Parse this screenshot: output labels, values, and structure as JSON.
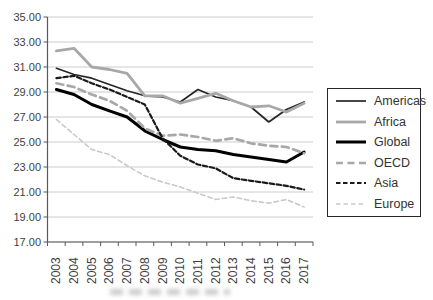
{
  "chart_data": {
    "type": "line",
    "title": "",
    "xlabel": "",
    "ylabel": "",
    "x": [
      2003,
      2004,
      2005,
      2006,
      2007,
      2008,
      2009,
      2010,
      2011,
      2012,
      2013,
      2014,
      2015,
      2016,
      2017
    ],
    "ylim": [
      17,
      35
    ],
    "y_tick_labels": [
      "35.00",
      "33.00",
      "31.00",
      "29.00",
      "27.00",
      "25.00",
      "23.00",
      "21.00",
      "19.00",
      "17.00"
    ],
    "grid": true,
    "legend_position": "right",
    "series": [
      {
        "name": "Americas",
        "color": "#262626",
        "width": 1.7,
        "dash": null,
        "values": [
          30.9,
          30.4,
          30.1,
          29.6,
          29.1,
          28.7,
          28.6,
          28.2,
          29.2,
          28.6,
          28.3,
          27.8,
          26.6,
          27.6,
          28.2
        ]
      },
      {
        "name": "Africa",
        "color": "#a8a8a8",
        "width": 2.8,
        "dash": null,
        "values": [
          32.3,
          32.5,
          31.0,
          30.8,
          30.5,
          28.7,
          28.7,
          28.1,
          28.5,
          28.9,
          28.3,
          27.8,
          27.9,
          27.4,
          28.1
        ]
      },
      {
        "name": "Global",
        "color": "#000000",
        "width": 3.0,
        "dash": null,
        "values": [
          29.2,
          28.8,
          28.0,
          27.5,
          27.0,
          25.9,
          25.2,
          24.6,
          24.4,
          24.3,
          24.0,
          23.8,
          23.6,
          23.4,
          24.2
        ]
      },
      {
        "name": "OECD",
        "color": "#a8a8a8",
        "width": 2.7,
        "dash": "7 4.5",
        "values": [
          29.7,
          29.4,
          28.8,
          28.3,
          27.5,
          26.1,
          25.5,
          25.6,
          25.4,
          25.1,
          25.3,
          24.9,
          24.7,
          24.6,
          24.1
        ]
      },
      {
        "name": "Asia",
        "color": "#1a1a1a",
        "width": 2.2,
        "dash": "4.5 2.5",
        "values": [
          30.1,
          30.3,
          29.7,
          29.2,
          28.6,
          28.0,
          25.3,
          23.9,
          23.2,
          22.9,
          22.1,
          21.9,
          21.7,
          21.5,
          21.2
        ]
      },
      {
        "name": "Europe",
        "color": "#c9c9c9",
        "width": 1.6,
        "dash": "4.5 3",
        "values": [
          26.8,
          25.6,
          24.4,
          24.0,
          23.1,
          22.3,
          21.8,
          21.4,
          20.9,
          20.4,
          20.6,
          20.3,
          20.1,
          20.4,
          19.8
        ]
      }
    ]
  },
  "colors": {
    "background": "#ffffff",
    "gridline": "#cccccc",
    "axis": "#595959",
    "tick_text": "#3f3f3f",
    "legend_border": "#262626"
  }
}
